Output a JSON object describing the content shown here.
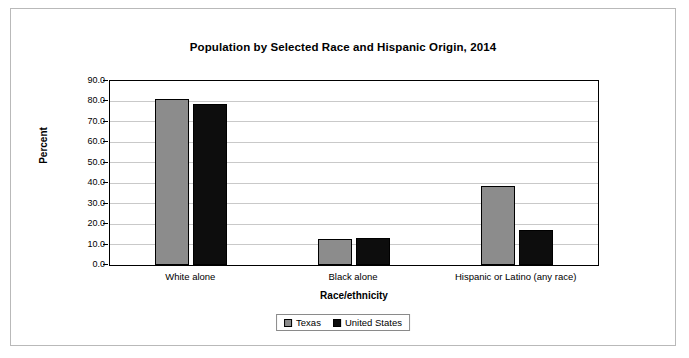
{
  "chart_data": {
    "type": "bar",
    "title": "Population by Selected Race and Hispanic Origin, 2014",
    "xlabel": "Race/ethnicity",
    "ylabel": "Percent",
    "categories": [
      "White alone",
      "Black alone",
      "Hispanic or Latino (any race)"
    ],
    "series": [
      {
        "name": "Texas",
        "values": [
          81.4,
          12.5,
          38.6
        ],
        "color": "#8c8c8c"
      },
      {
        "name": "United States",
        "values": [
          79.0,
          13.2,
          17.1
        ],
        "color": "#0d0d0d"
      }
    ],
    "ylim": [
      0.0,
      90.0
    ],
    "ytick_labels": [
      "0.0",
      "10.0",
      "20.0",
      "30.0",
      "40.0",
      "50.0",
      "60.0",
      "70.0",
      "80.0",
      "90.0"
    ],
    "ytick_values": [
      0,
      10,
      20,
      30,
      40,
      50,
      60,
      70,
      80,
      90
    ],
    "grid": true,
    "legend_position": "bottom"
  }
}
